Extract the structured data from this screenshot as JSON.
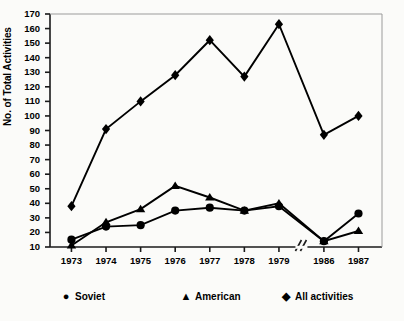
{
  "chart_data": {
    "type": "line",
    "title": "",
    "xlabel": "",
    "ylabel": "No. of Total Activities",
    "categories": [
      "1973",
      "1974",
      "1975",
      "1976",
      "1977",
      "1978",
      "1979",
      "1986",
      "1987"
    ],
    "x_tick_labels": [
      "1973",
      "1974",
      "1975",
      "1976",
      "1977",
      "1978",
      "1979",
      "1986",
      "1987"
    ],
    "y_tick_labels": [
      "10",
      "20",
      "30",
      "40",
      "50",
      "60",
      "70",
      "80",
      "90",
      "100",
      "110",
      "120",
      "130",
      "140",
      "150",
      "160",
      "170"
    ],
    "y_ticks": [
      10,
      20,
      30,
      40,
      50,
      60,
      70,
      80,
      90,
      100,
      110,
      120,
      130,
      140,
      150,
      160,
      170
    ],
    "ylim": [
      10,
      170
    ],
    "grid": false,
    "legend_position": "below",
    "axis_break": {
      "symbol": "//",
      "between": [
        "1979",
        "1986"
      ]
    },
    "series": [
      {
        "name": "Soviet",
        "marker": "circle",
        "glyph": "●",
        "color": "#000000",
        "values": [
          15,
          24,
          25,
          35,
          37,
          35,
          38,
          14,
          33
        ]
      },
      {
        "name": "American",
        "marker": "triangle",
        "glyph": "▲",
        "color": "#000000",
        "values": [
          11,
          27,
          36,
          52,
          44,
          35,
          40,
          14,
          21
        ]
      },
      {
        "name": "All activities",
        "marker": "diamond",
        "glyph": "◆",
        "color": "#000000",
        "values": [
          38,
          91,
          110,
          128,
          152,
          127,
          163,
          87,
          100
        ]
      }
    ]
  },
  "legend": {
    "items": [
      {
        "label": "Soviet",
        "glyph": "●"
      },
      {
        "label": "American",
        "glyph": "▲"
      },
      {
        "label": "All activities",
        "glyph": "◆"
      }
    ]
  }
}
